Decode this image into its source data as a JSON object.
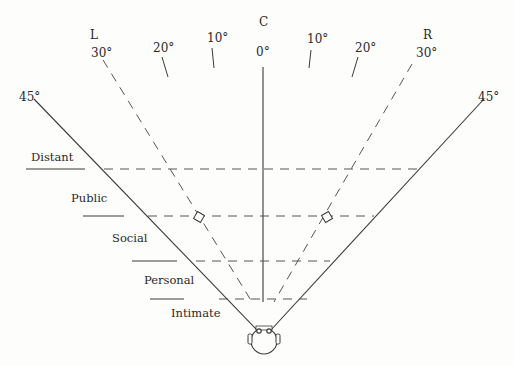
{
  "diagram": {
    "direction_labels": {
      "left": "L",
      "center": "C",
      "right": "R"
    },
    "angle_labels": {
      "left_30": "30°",
      "left_20": "20°",
      "left_10": "10°",
      "center_0": "0°",
      "right_10": "10°",
      "right_20": "20°",
      "right_30": "30°",
      "left_45": "45°",
      "right_45": "45°"
    },
    "zones": [
      {
        "label": "Distant"
      },
      {
        "label": "Public"
      },
      {
        "label": "Social"
      },
      {
        "label": "Personal"
      },
      {
        "label": "Intimate"
      }
    ],
    "colors": {
      "line": "#3a3a3a",
      "dash": "#555555",
      "background": "#fdfdfc"
    }
  }
}
